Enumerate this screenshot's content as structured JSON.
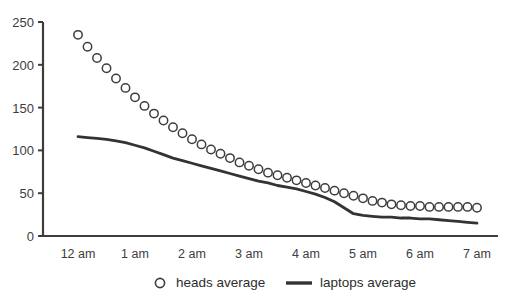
{
  "chart_data": {
    "type": "line",
    "title": "",
    "xlabel": "",
    "ylabel": "",
    "ylim": [
      0,
      250
    ],
    "yticks": [
      0,
      50,
      100,
      150,
      200,
      250
    ],
    "xticks": [
      "12 am",
      "1 am",
      "2 am",
      "3 am",
      "4 am",
      "5 am",
      "6 am",
      "7 am"
    ],
    "grid": false,
    "legend_position": "bottom",
    "x_hours": [
      0,
      0.1667,
      0.3333,
      0.5,
      0.6667,
      0.8333,
      1,
      1.1667,
      1.3333,
      1.5,
      1.6667,
      1.8333,
      2,
      2.1667,
      2.3333,
      2.5,
      2.6667,
      2.8333,
      3,
      3.1667,
      3.3333,
      3.5,
      3.6667,
      3.8333,
      4,
      4.1667,
      4.3333,
      4.5,
      4.6667,
      4.8333,
      5,
      5.1667,
      5.3333,
      5.5,
      5.6667,
      5.8333,
      6,
      6.1667,
      6.3333,
      6.5,
      6.6667,
      6.8333,
      7
    ],
    "series": [
      {
        "name": "heads average",
        "marker": "circle-open",
        "color": "#3d3d3d",
        "values": [
          235,
          221,
          208,
          196,
          184,
          173,
          162,
          152,
          143,
          135,
          127,
          120,
          113,
          107,
          101,
          96,
          91,
          86,
          82,
          78,
          74,
          71,
          68,
          65,
          62,
          59,
          56,
          53,
          50,
          47,
          44,
          41,
          39,
          37,
          36,
          35,
          35,
          34,
          34,
          34,
          34,
          34,
          33
        ]
      },
      {
        "name": "laptops average",
        "marker": "line",
        "color": "#333333",
        "values": [
          116,
          115,
          114,
          113,
          111,
          109,
          106,
          103,
          99,
          95,
          91,
          88,
          85,
          82,
          79,
          76,
          73,
          70,
          67,
          64,
          62,
          59,
          57,
          55,
          52,
          49,
          45,
          40,
          33,
          26,
          24,
          23,
          22,
          22,
          21,
          21,
          20,
          20,
          19,
          18,
          17,
          16,
          15
        ]
      }
    ]
  },
  "legend": {
    "items": [
      {
        "label": "heads average",
        "marker": "circle-open"
      },
      {
        "label": "laptops average",
        "marker": "line"
      }
    ]
  },
  "axes": {
    "y_labels": [
      "250",
      "200",
      "150",
      "100",
      "50",
      "0"
    ],
    "x_labels": [
      "12 am",
      "1 am",
      "2 am",
      "3 am",
      "4 am",
      "5 am",
      "6 am",
      "7 am"
    ]
  },
  "colors": {
    "ink": "#3d3d3d",
    "axis": "#3d3d3d",
    "line": "#333333",
    "background": "#ffffff"
  }
}
